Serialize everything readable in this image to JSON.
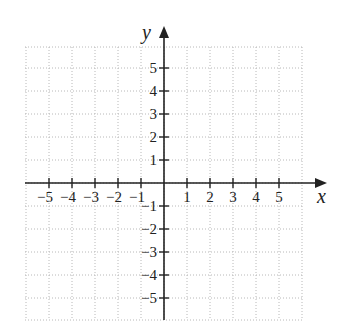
{
  "chart_data": {
    "type": "coordinate-grid",
    "title": "",
    "xlabel": "x",
    "ylabel": "y",
    "xlim": [
      -6,
      6
    ],
    "ylim": [
      -6,
      6
    ],
    "grid": true,
    "grid_style": "dotted",
    "x_ticks": [
      -5,
      -4,
      -3,
      -2,
      -1,
      1,
      2,
      3,
      4,
      5
    ],
    "y_ticks": [
      -5,
      -4,
      -3,
      -2,
      -1,
      1,
      2,
      3,
      4,
      5
    ],
    "x_tick_labels": [
      "−5",
      "−4",
      "−3",
      "−2",
      "−1",
      "1",
      "2",
      "3",
      "4",
      "5"
    ],
    "y_tick_labels": [
      "−5",
      "−4",
      "−3",
      "−2",
      "−1",
      "1",
      "2",
      "3",
      "4",
      "5"
    ],
    "series": []
  },
  "layout": {
    "origin_px": [
      164,
      183
    ],
    "unit_px": 23,
    "grid_left": 25,
    "grid_right": 303,
    "grid_top": 47,
    "grid_bottom": 320,
    "x_axis_end": 327,
    "y_axis_top": 26
  },
  "colors": {
    "axis": "#222222",
    "grid": "#b8b8b8",
    "background": "#ffffff"
  }
}
